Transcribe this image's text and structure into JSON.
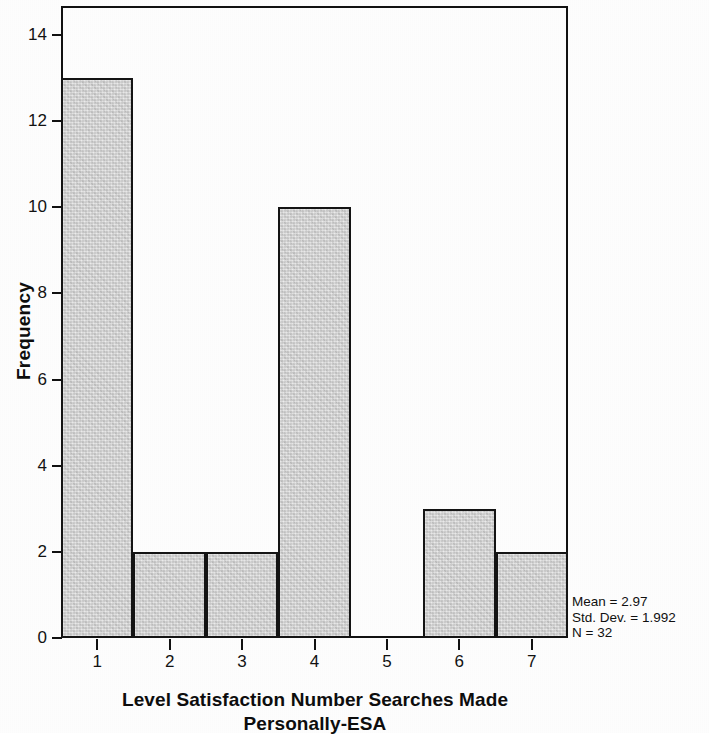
{
  "chart_data": {
    "type": "bar",
    "title": "",
    "xlabel": "Level Satisfaction Number Searches Made Personally-ESA",
    "xlabel_line1": "Level Satisfaction Number Searches Made",
    "xlabel_line2": "Personally-ESA",
    "ylabel": "Frequency",
    "categories": [
      "1",
      "2",
      "3",
      "4",
      "5",
      "6",
      "7"
    ],
    "values": [
      13,
      2,
      2,
      10,
      0,
      3,
      2
    ],
    "xlim": [
      0.5,
      7.5
    ],
    "ylim": [
      0,
      14.65
    ],
    "ytick_labels": [
      "0",
      "2",
      "4",
      "6",
      "8",
      "10",
      "12",
      "14"
    ],
    "ytick_values": [
      0,
      2,
      4,
      6,
      8,
      10,
      12,
      14
    ],
    "xtick_labels": [
      "1",
      "2",
      "3",
      "4",
      "5",
      "6",
      "7"
    ],
    "grid": false,
    "legend": false,
    "bar_fill_color": "#d6d6d6",
    "bar_edge_color": "#141414",
    "annotations": {
      "mean": "Mean = 2.97",
      "std_dev": "Std. Dev. = 1.992",
      "n": "N = 32"
    }
  }
}
